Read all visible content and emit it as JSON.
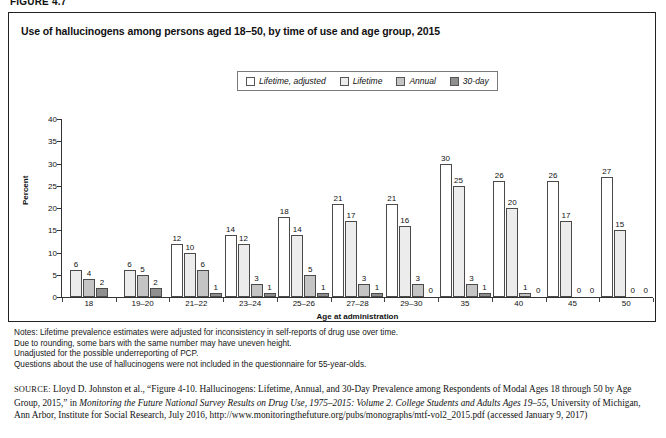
{
  "figure_number": "FIGURE 4.7",
  "chart_title": "Use of hallucinogens among persons aged 18–50, by time of use and age group, 2015",
  "legend": {
    "items": [
      {
        "label": "Lifetime, adjusted",
        "color": "#ffffff",
        "icon": "square-swatch-icon"
      },
      {
        "label": "Lifetime",
        "color": "#ececec",
        "icon": "square-swatch-icon"
      },
      {
        "label": "Annual",
        "color": "#c4c4c4",
        "icon": "square-swatch-icon"
      },
      {
        "label": "30-day",
        "color": "#8f8f8f",
        "icon": "square-swatch-icon"
      }
    ]
  },
  "chart_data": {
    "type": "bar",
    "title": "Use of hallucinogens among persons aged 18–50, by time of use and age group, 2015",
    "xlabel": "Age at administration",
    "ylabel": "Percent",
    "ylim": [
      0,
      40
    ],
    "yticks": [
      0,
      5,
      10,
      15,
      20,
      25,
      30,
      35,
      40
    ],
    "grid": false,
    "legend_position": "top-center",
    "categories": [
      "18",
      "19–20",
      "21–22",
      "23–24",
      "25–26",
      "27–28",
      "29–30",
      "35",
      "40",
      "45",
      "50"
    ],
    "series": [
      {
        "name": "Lifetime, adjusted",
        "color": "#ffffff",
        "values": [
          null,
          null,
          12,
          14,
          18,
          21,
          21,
          30,
          26,
          26,
          27
        ]
      },
      {
        "name": "Lifetime",
        "color": "#ececec",
        "values": [
          6,
          6,
          10,
          12,
          14,
          17,
          16,
          25,
          20,
          17,
          15
        ]
      },
      {
        "name": "Annual",
        "color": "#c4c4c4",
        "values": [
          4,
          5,
          6,
          3,
          5,
          3,
          3,
          3,
          1,
          0,
          0
        ]
      },
      {
        "name": "30-day",
        "color": "#8f8f8f",
        "values": [
          2,
          2,
          1,
          1,
          1,
          1,
          0,
          1,
          0,
          0,
          0
        ]
      }
    ]
  },
  "notes": [
    "Notes: Lifetime prevalence estimates were adjusted for inconsistency in self-reports of drug use over time.",
    "Due to rounding, some bars with the same number may have uneven height.",
    "Unadjusted for the possible underreporting of PCP.",
    "Questions about the use of hallucinogens were not included in the questionnaire for 55-year-olds."
  ],
  "source": {
    "label": "SOURCE:",
    "text_1": " Lloyd D. Johnston et al., “Figure 4-10. Hallucinogens: Lifetime, Annual, and 30-Day Prevalence among Respondents of Modal Ages 18 through 50 by Age Group, 2015,” in ",
    "italic_1": "Monitoring the Future National Survey Results on Drug Use, 1975–2015: Volume 2. College Students and Adults Ages 19–55,",
    "text_2": " University of Michigan, Ann Arbor, Institute for Social Research, July 2016, http://www.monitoringthefuture.org/pubs/monographs/mtf-vol2_2015.pdf (accessed January 9, 2017)"
  }
}
